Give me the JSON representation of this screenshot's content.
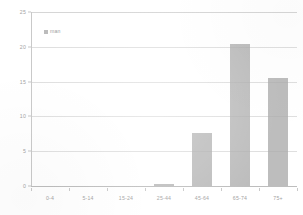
{
  "chart_data": {
    "type": "bar",
    "title": "",
    "subtitle": "",
    "xlabel": "",
    "ylabel": "",
    "categories": [
      "0-4",
      "5-14",
      "15-24",
      "25-44",
      "45-64",
      "65-74",
      "75+"
    ],
    "values": [
      0,
      0,
      0,
      0.3,
      7.6,
      20.4,
      15.5
    ],
    "series": [
      {
        "name": "man",
        "values": [
          0,
          0,
          0,
          0.3,
          7.6,
          20.4,
          15.5
        ],
        "color": "#ababab"
      }
    ],
    "ylim": [
      0,
      25
    ],
    "yticks": [
      0,
      5,
      10,
      15,
      20,
      25
    ],
    "ytick_labels": [
      "0",
      "5",
      "10",
      "15",
      "20",
      "25"
    ],
    "grid": true,
    "grid_axis": "y",
    "legend": [
      "man"
    ],
    "legend_position": "top-left-inside",
    "annotations": []
  },
  "legend": {
    "entries": [
      {
        "label": "man",
        "swatch_color": "#ababab",
        "marker": "square-swatch-icon"
      }
    ]
  },
  "axes": {
    "y": {
      "ticks": [
        "0",
        "5",
        "10",
        "15",
        "20",
        "25"
      ],
      "min": 0,
      "max": 25
    },
    "x": {
      "ticks": [
        "0-4",
        "5-14",
        "15-24",
        "25-44",
        "45-64",
        "65-74",
        "75+"
      ]
    }
  },
  "colors": {
    "bar": "#ababab",
    "grid": "#d9d9d9",
    "axis": "#c5c5c5",
    "text": "#a3a3a3",
    "background": "#ffffff"
  }
}
